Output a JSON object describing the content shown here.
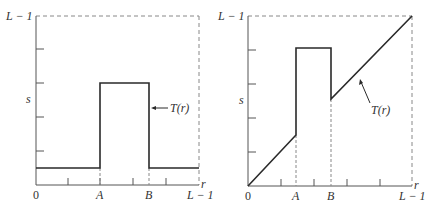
{
  "figure": {
    "panels": [
      {
        "id": "left",
        "title": "",
        "y_top_label": "L − 1",
        "y_axis_label": "s",
        "x_axis_label": "r",
        "x_tick_labels": [
          "0",
          "A",
          "B",
          "L − 1"
        ],
        "curve_label": "T(r)",
        "description": "Intensity-level slicing: high value for A ≤ r ≤ B, low constant elsewhere"
      },
      {
        "id": "right",
        "title": "",
        "y_top_label": "L − 1",
        "y_axis_label": "s",
        "x_axis_label": "r",
        "x_tick_labels": [
          "0",
          "A",
          "B",
          "L − 1"
        ],
        "curve_label": "T(r)",
        "description": "Intensity-level slicing: identity ramp with band A–B raised to high value"
      }
    ],
    "colors": {
      "curve": "#2a2a2a",
      "axis": "#555555",
      "dashed": "#888888",
      "text": "#333333"
    }
  }
}
